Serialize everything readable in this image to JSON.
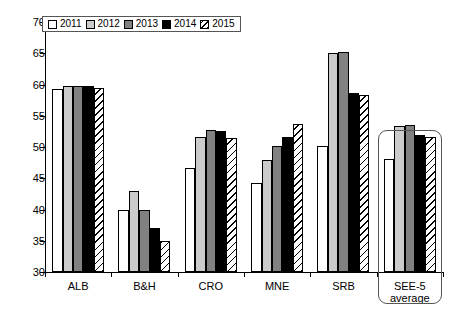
{
  "chart_data": {
    "type": "bar",
    "title": "",
    "subtitle": "",
    "xlabel": "",
    "ylabel": "",
    "ylim": [
      30,
      70
    ],
    "ytick_labels": [
      "70",
      "65",
      "60",
      "55",
      "50",
      "45",
      "40",
      "35",
      "30"
    ],
    "yticks": [
      70,
      65,
      60,
      55,
      50,
      45,
      40,
      35,
      30
    ],
    "grid": false,
    "legend_position": "top-left",
    "categories": [
      "ALB",
      "B&H",
      "CRO",
      "MNE",
      "SRB",
      "SEE-5 average"
    ],
    "category_labels": [
      {
        "line1": "ALB",
        "line2": ""
      },
      {
        "line1": "B&H",
        "line2": ""
      },
      {
        "line1": "CRO",
        "line2": ""
      },
      {
        "line1": "MNE",
        "line2": ""
      },
      {
        "line1": "SRB",
        "line2": ""
      },
      {
        "line1": "SEE-5",
        "line2": "average"
      }
    ],
    "series": [
      {
        "name": "2011",
        "fill": "white",
        "color": "#ffffff",
        "values": [
          59.3,
          40.0,
          46.7,
          44.3,
          50.2,
          48.1
        ]
      },
      {
        "name": "2012",
        "fill": "light-gray",
        "color": "#cbcbcb",
        "values": [
          59.8,
          43.0,
          51.6,
          48.0,
          65.0,
          53.4
        ]
      },
      {
        "name": "2013",
        "fill": "dark-gray",
        "color": "#818181",
        "values": [
          59.8,
          40.0,
          52.8,
          50.2,
          65.2,
          53.6
        ]
      },
      {
        "name": "2014",
        "fill": "black",
        "color": "#000000",
        "values": [
          59.8,
          37.0,
          52.5,
          51.6,
          58.6,
          51.9
        ]
      },
      {
        "name": "2015",
        "fill": "hatched",
        "color": "#ffffff",
        "values": [
          59.5,
          35.0,
          51.4,
          53.7,
          58.3,
          51.6
        ]
      }
    ],
    "annotations": [
      {
        "name": "see5-highlight-box",
        "target_category": "SEE-5 average",
        "shape": "rounded-rectangle"
      }
    ]
  },
  "legend": {
    "items": [
      {
        "label": "2011",
        "fill": "white"
      },
      {
        "label": "2012",
        "fill": "light-gray"
      },
      {
        "label": "2013",
        "fill": "dark-gray"
      },
      {
        "label": "2014",
        "fill": "black"
      },
      {
        "label": "2015",
        "fill": "hatched"
      }
    ]
  }
}
